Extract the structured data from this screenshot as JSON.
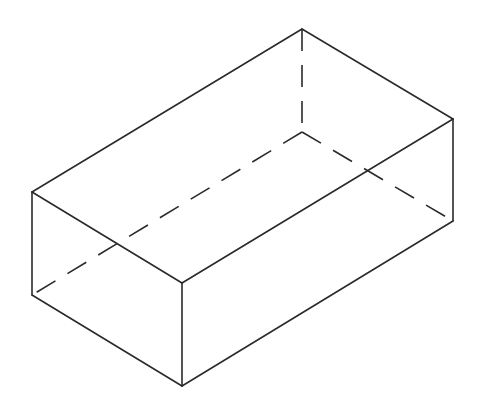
{
  "figure": {
    "title": "",
    "stroke_color": "#2a2a2a",
    "background": "#ffffff",
    "vertices": {
      "top_back": [
        302,
        29
      ],
      "top_right": [
        453,
        119
      ],
      "top_left": [
        32,
        192
      ],
      "top_front": [
        182,
        283
      ],
      "bottom_left": [
        32,
        295
      ],
      "bottom_front": [
        182,
        386
      ],
      "bottom_right": [
        453,
        221
      ],
      "bottom_back_hidden": [
        302,
        132
      ]
    },
    "visible_edges": [
      [
        "top_back",
        "top_right"
      ],
      [
        "top_back",
        "top_left"
      ],
      [
        "top_left",
        "top_front"
      ],
      [
        "top_front",
        "top_right"
      ],
      [
        "top_left",
        "bottom_left"
      ],
      [
        "top_front",
        "bottom_front"
      ],
      [
        "top_right",
        "bottom_right"
      ],
      [
        "bottom_left",
        "bottom_front"
      ],
      [
        "bottom_front",
        "bottom_right"
      ]
    ],
    "hidden_edges": [
      [
        "top_back",
        "bottom_back_hidden"
      ],
      [
        "bottom_back_hidden",
        "bottom_left"
      ],
      [
        "bottom_back_hidden",
        "bottom_right"
      ]
    ]
  }
}
